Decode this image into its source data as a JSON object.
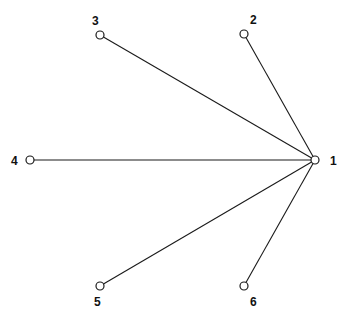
{
  "diagram": {
    "type": "star-graph",
    "nodes": [
      {
        "id": "1",
        "label": "1",
        "x": 315,
        "y": 160,
        "lx": 330,
        "ly": 165
      },
      {
        "id": "2",
        "label": "2",
        "x": 244,
        "y": 34,
        "lx": 250,
        "ly": 24
      },
      {
        "id": "3",
        "label": "3",
        "x": 100,
        "y": 35,
        "lx": 92,
        "ly": 25
      },
      {
        "id": "4",
        "label": "4",
        "x": 30,
        "y": 160,
        "lx": 11,
        "ly": 165
      },
      {
        "id": "5",
        "label": "5",
        "x": 100,
        "y": 286,
        "lx": 94,
        "ly": 306
      },
      {
        "id": "6",
        "label": "6",
        "x": 244,
        "y": 286,
        "lx": 250,
        "ly": 306
      }
    ],
    "edges": [
      {
        "from": "1",
        "to": "2"
      },
      {
        "from": "1",
        "to": "3"
      },
      {
        "from": "1",
        "to": "4"
      },
      {
        "from": "1",
        "to": "5"
      },
      {
        "from": "1",
        "to": "6"
      }
    ],
    "node_radius": 4
  }
}
